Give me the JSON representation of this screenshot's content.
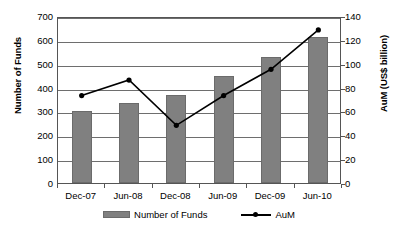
{
  "chart_data": {
    "type": "bar",
    "title": "",
    "subtitle": "",
    "xlabel": "",
    "ylabel": "Number of Funds",
    "y2label": "AuM (US$ billion)",
    "categories": [
      "Dec-07",
      "Jun-08",
      "Dec-08",
      "Jun-09",
      "Dec-09",
      "Jun-10"
    ],
    "series": [
      {
        "name": "Number of Funds",
        "type": "bar",
        "axis": "left",
        "color": "#808080",
        "values": [
          300,
          335,
          370,
          450,
          530,
          610
        ]
      },
      {
        "name": "AuM",
        "type": "line",
        "axis": "right",
        "color": "#000000",
        "marker": "circle",
        "values": [
          75,
          88,
          50,
          75,
          97,
          130
        ]
      }
    ],
    "ylim": [
      0,
      700
    ],
    "yticks": [
      0,
      100,
      200,
      300,
      400,
      500,
      600,
      700
    ],
    "y2lim": [
      0,
      140
    ],
    "y2ticks": [
      0,
      20,
      40,
      60,
      80,
      100,
      120,
      140
    ],
    "grid": true,
    "legend_position": "bottom"
  },
  "legend": {
    "entries": [
      {
        "label": "Number of Funds",
        "marker": "bar-swatch"
      },
      {
        "label": "AuM",
        "marker": "line-marker-swatch"
      }
    ]
  },
  "colors": {
    "bar_fill": "#808080",
    "bar_border": "#6b6b6b",
    "line": "#000000",
    "gridline": "#6e6e6e",
    "plot_border": "#555555",
    "background": "#ffffff",
    "text": "#000000"
  }
}
